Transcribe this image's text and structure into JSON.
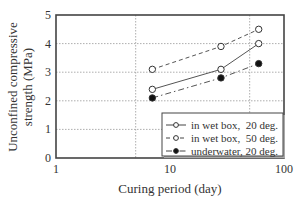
{
  "chart_data": {
    "type": "line",
    "title": "",
    "xlabel": "Curing period (day)",
    "ylabel_line1": "Unconfined compressive",
    "ylabel_line2": "strength (MPa)",
    "ylabel": "Unconfined compressive strength (MPa)",
    "xscale": "log",
    "xlim": [
      1,
      100
    ],
    "ylim": [
      0,
      5
    ],
    "xticks": [
      "1",
      "10",
      "100"
    ],
    "yticks": [
      "0",
      "1",
      "2",
      "3",
      "4",
      "5"
    ],
    "grid": {
      "horizontal": [
        1,
        2,
        3,
        4
      ],
      "vertical": [
        5,
        50
      ],
      "style": "dotted"
    },
    "legend_position": "lower right",
    "x": [
      7,
      28,
      60
    ],
    "series": [
      {
        "name": "in wet box,  20 deg.",
        "marker": "open-circle",
        "line": "solid",
        "values": [
          2.4,
          3.1,
          4.0
        ]
      },
      {
        "name": "in wet box,  50 deg.",
        "marker": "open-circle",
        "line": "dashed",
        "values": [
          3.1,
          3.9,
          4.5
        ]
      },
      {
        "name": "underwater, 20 deg.",
        "marker": "filled-circle",
        "line": "dash-dot",
        "values": [
          2.1,
          2.8,
          3.3
        ]
      }
    ]
  }
}
